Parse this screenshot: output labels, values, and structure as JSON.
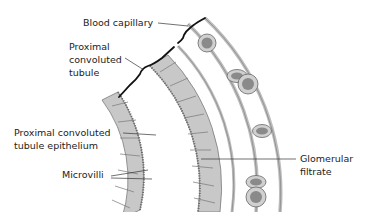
{
  "diagram": {
    "labels": {
      "blood_capillary": "Blood capillary",
      "pct": "Proximal\nconvoluted\ntubule",
      "pct_epithelium": "Proximal convoluted\ntubule epithelium",
      "microvilli": "Microvilli",
      "glomerular_filtrate": "Glomerular\nfiltrate"
    },
    "colors": {
      "cell_fill": "#c8c8c8",
      "cell_stroke": "#7a7a7a",
      "capillary_wall": "#bdbdbd",
      "rbc_outer": "#d0d0d0",
      "rbc_inner": "#8a8a8a",
      "bracket": "#111111",
      "leader_line": "#333333"
    }
  }
}
